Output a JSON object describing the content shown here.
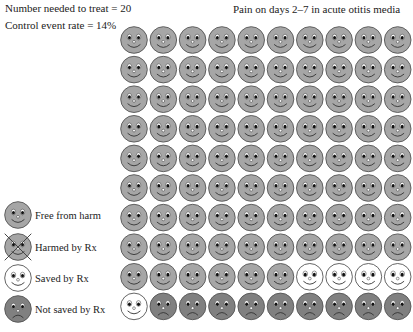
{
  "header": {
    "nnt_label": "Number needed to treat = 20",
    "cer_label": "Control event rate = 14%",
    "title": "Pain on days 2–7 in acute otitis media"
  },
  "legend": {
    "items": [
      {
        "key": "free",
        "label": "Free from harm"
      },
      {
        "key": "harmed",
        "label": "Harmed by Rx"
      },
      {
        "key": "saved",
        "label": "Saved by Rx"
      },
      {
        "key": "notsaved",
        "label": "Not saved by Rx"
      }
    ]
  },
  "colors": {
    "free": "#a6a6a6",
    "harmed": "#a6a6a6",
    "saved": "#ffffff",
    "notsaved": "#808080",
    "outline": "#555555"
  },
  "chart_data": {
    "type": "table",
    "title": "Pain on days 2–7 in acute otitis media",
    "subtitle": [
      "Number needed to treat = 20",
      "Control event rate = 14%"
    ],
    "grid": {
      "rows": 10,
      "cols": 10,
      "total": 100
    },
    "counts": {
      "free": 86,
      "harmed": 0,
      "saved": 5,
      "notsaved": 9
    },
    "legend": [
      "Free from harm",
      "Harmed by Rx",
      "Saved by Rx",
      "Not saved by Rx"
    ],
    "layout": [
      [
        "free",
        "free",
        "free",
        "free",
        "free",
        "free",
        "free",
        "free",
        "free",
        "free"
      ],
      [
        "free",
        "free",
        "free",
        "free",
        "free",
        "free",
        "free",
        "free",
        "free",
        "free"
      ],
      [
        "free",
        "free",
        "free",
        "free",
        "free",
        "free",
        "free",
        "free",
        "free",
        "free"
      ],
      [
        "free",
        "free",
        "free",
        "free",
        "free",
        "free",
        "free",
        "free",
        "free",
        "free"
      ],
      [
        "free",
        "free",
        "free",
        "free",
        "free",
        "free",
        "free",
        "free",
        "free",
        "free"
      ],
      [
        "free",
        "free",
        "free",
        "free",
        "free",
        "free",
        "free",
        "free",
        "free",
        "free"
      ],
      [
        "free",
        "free",
        "free",
        "free",
        "free",
        "free",
        "free",
        "free",
        "free",
        "free"
      ],
      [
        "free",
        "free",
        "free",
        "free",
        "free",
        "free",
        "free",
        "free",
        "free",
        "free"
      ],
      [
        "free",
        "free",
        "free",
        "free",
        "free",
        "free",
        "saved",
        "saved",
        "saved",
        "saved"
      ],
      [
        "saved",
        "notsaved",
        "notsaved",
        "notsaved",
        "notsaved",
        "notsaved",
        "notsaved",
        "notsaved",
        "notsaved",
        "notsaved"
      ]
    ]
  }
}
